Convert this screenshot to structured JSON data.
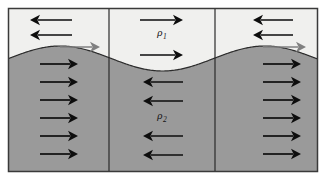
{
  "figure": {
    "type": "physics-schematic",
    "title_visible": false,
    "width": 327,
    "height": 182,
    "background_color": "#ffffff",
    "frame": {
      "x": 8,
      "y": 8,
      "width": 310,
      "height": 164,
      "border_color": "#3a3a3a",
      "border_width": 1.5
    }
  },
  "fluids": {
    "upper": {
      "label": "ρ",
      "subscript": "1",
      "color": "#f0f0ee",
      "label_x": 162,
      "label_y": 36
    },
    "lower": {
      "label": "ρ",
      "subscript": "2",
      "color": "#9a9a9a",
      "label_x": 162,
      "label_y": 119
    }
  },
  "interface": {
    "shape": "sine-wave",
    "stroke_color": "#2b2b2b",
    "stroke_width": 1.2,
    "crest_y": 46,
    "trough_y": 71,
    "mid_y": 58.5,
    "crest_x_left": 60,
    "trough_x_center": 162,
    "crest_x_right": 265
  },
  "dividers": {
    "color": "#2b2b2b",
    "width": 1.2,
    "x_positions": [
      109,
      215
    ]
  },
  "panels": [
    {
      "name": "left-panel",
      "x_start": 8,
      "x_end": 109,
      "upper_arrows": {
        "direction": "left",
        "color": "#0d0d0d",
        "count": 2,
        "items": [
          {
            "tip_x": 30,
            "tail_x": 72,
            "y": 20
          },
          {
            "tip_x": 30,
            "tail_x": 72,
            "y": 35
          }
        ]
      },
      "interface_arrow": {
        "direction": "right",
        "color": "#808080",
        "tail_x": 60,
        "tip_x": 100,
        "y": 47
      },
      "lower_arrows": {
        "direction": "right",
        "color": "#0d0d0d",
        "count": 6,
        "items": [
          {
            "tail_x": 40,
            "tip_x": 78,
            "y": 64
          },
          {
            "tail_x": 40,
            "tip_x": 78,
            "y": 82
          },
          {
            "tail_x": 40,
            "tip_x": 78,
            "y": 100
          },
          {
            "tail_x": 40,
            "tip_x": 78,
            "y": 118
          },
          {
            "tail_x": 40,
            "tip_x": 78,
            "y": 136
          },
          {
            "tail_x": 40,
            "tip_x": 78,
            "y": 154
          }
        ]
      }
    },
    {
      "name": "center-panel",
      "x_start": 109,
      "x_end": 215,
      "upper_arrows": {
        "direction": "right",
        "color": "#0d0d0d",
        "count": 2,
        "items": [
          {
            "tail_x": 140,
            "tip_x": 183,
            "y": 20
          },
          {
            "tail_x": 140,
            "tip_x": 183,
            "y": 55
          }
        ]
      },
      "interface_arrow": null,
      "lower_arrows": {
        "direction": "left",
        "color": "#0d0d0d",
        "count": 4,
        "items": [
          {
            "tip_x": 143,
            "tail_x": 183,
            "y": 82
          },
          {
            "tip_x": 143,
            "tail_x": 183,
            "y": 101
          },
          {
            "tip_x": 143,
            "tail_x": 183,
            "y": 136
          },
          {
            "tip_x": 143,
            "tail_x": 183,
            "y": 155
          }
        ]
      }
    },
    {
      "name": "right-panel",
      "x_start": 215,
      "x_end": 318,
      "upper_arrows": {
        "direction": "left",
        "color": "#0d0d0d",
        "count": 2,
        "items": [
          {
            "tip_x": 253,
            "tail_x": 293,
            "y": 20
          },
          {
            "tip_x": 253,
            "tail_x": 293,
            "y": 35
          }
        ]
      },
      "interface_arrow": {
        "direction": "right",
        "color": "#808080",
        "tail_x": 263,
        "tip_x": 306,
        "y": 47
      },
      "lower_arrows": {
        "direction": "right",
        "color": "#0d0d0d",
        "count": 6,
        "items": [
          {
            "tail_x": 263,
            "tip_x": 301,
            "y": 64
          },
          {
            "tail_x": 263,
            "tip_x": 301,
            "y": 82
          },
          {
            "tail_x": 263,
            "tip_x": 301,
            "y": 100
          },
          {
            "tail_x": 263,
            "tip_x": 301,
            "y": 118
          },
          {
            "tail_x": 263,
            "tip_x": 301,
            "y": 136
          },
          {
            "tail_x": 263,
            "tip_x": 301,
            "y": 154
          }
        ]
      }
    }
  ]
}
